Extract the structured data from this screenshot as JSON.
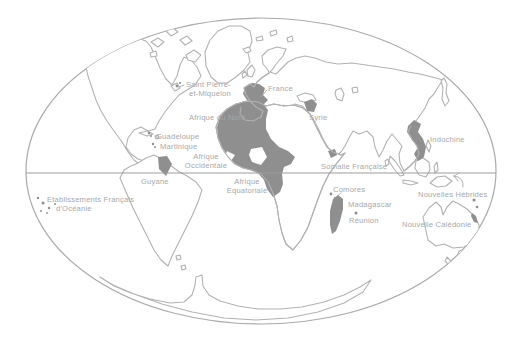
{
  "map": {
    "name": "World map of French overseas territories",
    "colors": {
      "background": "#ffffff",
      "outline": "#b2b2b2",
      "globe_outline": "#aaaaaa",
      "territory_fill": "#8f8f8f",
      "label": "#a8a8a8",
      "equator": "#9c9c9c"
    },
    "labels": {
      "saint_pierre_line1": "Saint Pierre-",
      "saint_pierre_line2": "et-Miquelon",
      "france": "France",
      "afrique_du_nord": "Afrique du Nord",
      "syrie": "Syrie",
      "guadeloupe": "Guadeloupe",
      "martinique": "Martinique",
      "afrique_occidentale_line1": "Afrique",
      "afrique_occidentale_line2": "Occidentale",
      "afrique_equatoriale_line1": "Afrique",
      "afrique_equatoriale_line2": "Equatoriale",
      "somalie_francaise": "Somalie Française",
      "guyane": "Guyane",
      "oceanie_line1": "Etablissements Français",
      "oceanie_line2": "d'Océanie",
      "comores": "Comores",
      "madagascar": "Madagascar",
      "reunion": "Réunion",
      "indochine": "Indochine",
      "nouvelles_hebrides": "Nouvelles Hébrides",
      "nouvelle_caledonie": "Nouvelle Calédonie"
    }
  }
}
